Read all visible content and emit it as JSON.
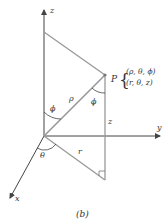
{
  "figure": {
    "caption": "(b)",
    "axes": {
      "x": "x",
      "y": "y",
      "z": "z"
    },
    "point": {
      "name": "P",
      "spherical": "(ρ, θ, ϕ)",
      "cylindrical": "(r, θ, z)"
    },
    "labels": {
      "rho": "ρ",
      "phi_origin": "ϕ",
      "phi_point": "ϕ",
      "theta": "θ",
      "r": "r",
      "z_height": "z"
    },
    "colors": {
      "line": "#999999",
      "axis": "#444444",
      "text": "#333333"
    }
  }
}
